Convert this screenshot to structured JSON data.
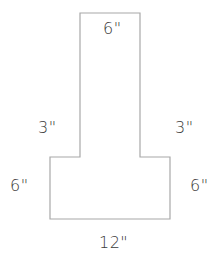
{
  "diagram": {
    "shape": "inverted-T composite rectangle",
    "stroke_color": "#a8a8a8",
    "label_color": "#3a3a3a",
    "outline_points": [
      [
        80,
        13
      ],
      [
        140,
        13
      ],
      [
        140,
        157
      ],
      [
        170,
        157
      ],
      [
        170,
        219
      ],
      [
        50,
        219
      ],
      [
        50,
        157
      ],
      [
        80,
        157
      ]
    ],
    "labels": {
      "top_width": "6\"",
      "left_step": "3\"",
      "right_step": "3\"",
      "left_side": "6\"",
      "right_side": "6\"",
      "bottom_width": "12\""
    }
  }
}
